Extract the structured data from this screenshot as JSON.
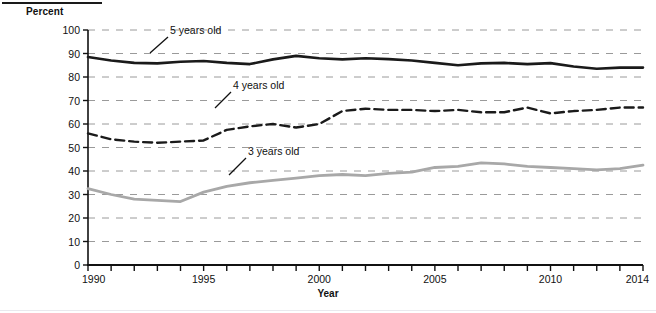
{
  "figure": {
    "y_axis_title": "Percent",
    "x_axis_title": "Year"
  },
  "chart_data": {
    "type": "line",
    "title": "",
    "subtitle": "",
    "xlabel": "Year",
    "ylabel": "Percent",
    "xlim": [
      1990,
      2014
    ],
    "ylim": [
      0,
      100
    ],
    "ytick_labels": [
      "0",
      "10",
      "20",
      "30",
      "40",
      "50",
      "60",
      "70",
      "80",
      "90",
      "100"
    ],
    "yticks": [
      0,
      10,
      20,
      30,
      40,
      50,
      60,
      70,
      80,
      90,
      100
    ],
    "xtick_labels": [
      "1990",
      "1995",
      "2000",
      "2005",
      "2010",
      "2014"
    ],
    "xticks_labeled": [
      1990,
      1995,
      2000,
      2005,
      2010,
      2014
    ],
    "xticks_minor": [
      1991,
      1992,
      1993,
      1994,
      1996,
      1997,
      1998,
      1999,
      2001,
      2002,
      2003,
      2004,
      2006,
      2007,
      2008,
      2009,
      2011,
      2012,
      2013
    ],
    "grid": "horizontal-dashed",
    "grid_color": "#9a9a9a",
    "legend": "inline-annotations",
    "x": [
      1990,
      1991,
      1992,
      1993,
      1994,
      1995,
      1996,
      1997,
      1998,
      1999,
      2000,
      2001,
      2002,
      2003,
      2004,
      2005,
      2006,
      2007,
      2008,
      2009,
      2010,
      2011,
      2012,
      2013,
      2014
    ],
    "series": [
      {
        "name": "5 years old",
        "label": "5 years old",
        "color": "#1a1a1a",
        "style": "solid",
        "width": 2.6,
        "values": [
          88.5,
          87.0,
          86.0,
          85.8,
          86.5,
          86.8,
          86.0,
          85.5,
          87.5,
          89.0,
          88.0,
          87.5,
          88.0,
          87.6,
          87.0,
          86.0,
          85.0,
          85.8,
          86.0,
          85.5,
          85.9,
          84.5,
          83.5,
          84.0,
          84.0
        ]
      },
      {
        "name": "4 years old",
        "label": "4 years old",
        "color": "#1a1a1a",
        "style": "dashed",
        "width": 2.4,
        "values": [
          56.0,
          53.5,
          52.5,
          52.0,
          52.5,
          53.0,
          57.5,
          59.0,
          60.0,
          58.5,
          60.0,
          65.5,
          66.5,
          66.0,
          66.0,
          65.5,
          66.0,
          65.0,
          65.0,
          67.0,
          64.5,
          65.5,
          66.0,
          67.0,
          67.0
        ]
      },
      {
        "name": "3 years old",
        "label": "3 years old",
        "color": "#a8a8a8",
        "style": "solid",
        "width": 2.8,
        "values": [
          32.5,
          30.0,
          28.0,
          27.5,
          27.0,
          31.0,
          33.5,
          35.0,
          36.0,
          37.0,
          38.0,
          38.5,
          38.0,
          39.0,
          39.5,
          41.5,
          42.0,
          43.5,
          43.0,
          42.0,
          41.5,
          41.0,
          40.5,
          41.0,
          42.5
        ]
      }
    ],
    "annotations": [
      {
        "text": "5 years old",
        "series": "5 years old",
        "text_x": 170,
        "text_y": 34
      },
      {
        "text": "4 years old",
        "series": "4 years old",
        "text_x": 233,
        "text_y": 89
      },
      {
        "text": "3 years old",
        "series": "3 years old",
        "text_x": 248,
        "text_y": 155
      }
    ]
  }
}
